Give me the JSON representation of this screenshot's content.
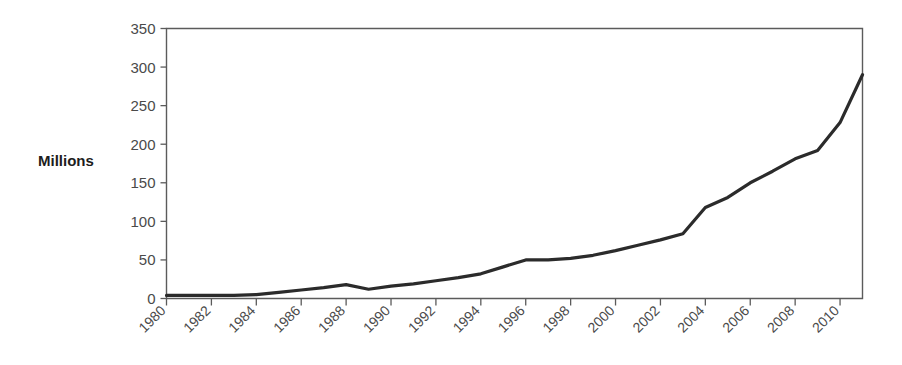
{
  "chart_data": {
    "type": "line",
    "title": "",
    "subtitle": "",
    "xlabel": "",
    "ylabel": "Millions",
    "xlim": [
      1980,
      2011
    ],
    "ylim": [
      0,
      350
    ],
    "grid": false,
    "legend": null,
    "legend_position": "none",
    "y_ticks": [
      0,
      50,
      100,
      150,
      200,
      250,
      300,
      350
    ],
    "y_tick_labels": [
      "0",
      "50",
      "100",
      "150",
      "200",
      "250",
      "300",
      "350"
    ],
    "x_ticks": [
      1980,
      1982,
      1984,
      1986,
      1988,
      1990,
      1992,
      1994,
      1996,
      1998,
      2000,
      2002,
      2004,
      2006,
      2008,
      2010
    ],
    "x_tick_labels": [
      "1980",
      "1982",
      "1984",
      "1986",
      "1988",
      "1990",
      "1992",
      "1994",
      "1996",
      "1998",
      "2000",
      "2002",
      "2004",
      "2006",
      "2008",
      "2010"
    ],
    "x_tick_rotation": -45,
    "series": [
      {
        "name": "Millions",
        "color": "#2b2b2b",
        "x": [
          1980,
          1981,
          1982,
          1983,
          1984,
          1985,
          1986,
          1987,
          1988,
          1989,
          1990,
          1991,
          1992,
          1993,
          1994,
          1995,
          1996,
          1997,
          1998,
          1999,
          2000,
          2001,
          2002,
          2003,
          2004,
          2005,
          2006,
          2007,
          2008,
          2009,
          2010,
          2011
        ],
        "values": [
          4,
          4,
          4,
          4,
          5,
          8,
          11,
          14,
          18,
          12,
          16,
          19,
          23,
          27,
          32,
          41,
          50,
          50,
          52,
          56,
          62,
          69,
          76,
          84,
          118,
          131,
          150,
          165,
          181,
          192,
          228,
          290
        ]
      }
    ],
    "annotations": []
  },
  "axis": {
    "y_label_text": "Millions"
  },
  "colors": {
    "line": "#2b2b2b",
    "frame": "#5b5b5b",
    "tick_text": "#4a4a4a",
    "axis_label": "#1d1d1d",
    "background": "#ffffff"
  }
}
